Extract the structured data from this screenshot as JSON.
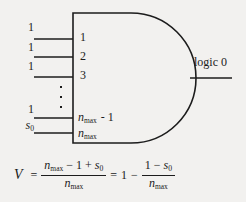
{
  "figure": {
    "type": "logic-gate-diagram",
    "gate": {
      "kind": "AND",
      "output_label": "logic 0",
      "pin_labels": [
        "1",
        "2",
        "3",
        "n_max - 1",
        "n_max"
      ],
      "pin_labels_display": {
        "p1": "1",
        "p2": "2",
        "p3": "3",
        "p4_var": "n",
        "p4_sub": "max",
        "p4_tail": "- 1",
        "p5_var": "n",
        "p5_sub": "max"
      }
    },
    "inputs": [
      {
        "signal": "1"
      },
      {
        "signal": "1"
      },
      {
        "signal": "1"
      },
      {
        "signal": "1"
      },
      {
        "signal": "s0"
      }
    ],
    "input_signal_display": {
      "i1": "1",
      "i2": "1",
      "i3": "1",
      "i4": "1",
      "i5_var": "s",
      "i5_sub": "0"
    },
    "vertical_ellipsis": "⋮"
  },
  "equation": {
    "lhs_variable": "V",
    "equals_1": "=",
    "frac1": {
      "numerator": "n_max - 1 + s0",
      "numerator_parts": {
        "n": "n",
        "max": "max",
        "minus": "−",
        "one": "1",
        "plus": "+",
        "s": "s",
        "zero": "0"
      },
      "denominator": "n_max",
      "denominator_parts": {
        "n": "n",
        "max": "max"
      }
    },
    "equals_2": "=",
    "one": "1",
    "minus": "−",
    "frac2": {
      "numerator": "1 - s0",
      "numerator_parts": {
        "one": "1",
        "minus": "−",
        "s": "s",
        "zero": "0"
      },
      "denominator": "n_max",
      "denominator_parts": {
        "n": "n",
        "max": "max"
      }
    },
    "plain_text": "V = (n_max - 1 + s0) / n_max = 1 - (1 - s0) / n_max"
  },
  "colors": {
    "background": "#f2f1ef",
    "ink": "#1c1c1c"
  }
}
